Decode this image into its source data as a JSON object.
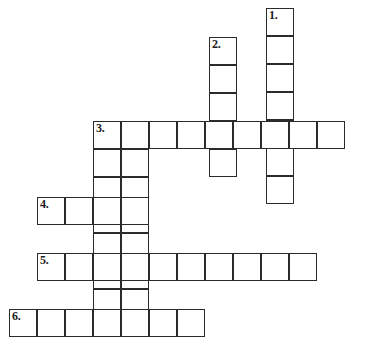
{
  "puzzle": {
    "title": "Crossword Puzzle Grid",
    "type": "crossword-grid",
    "canvas": {
      "width": 365,
      "height": 341
    },
    "cell_size": 28,
    "border_color": "#2b2b2b",
    "cell_fill": "#ffffff",
    "background": "#ffffff",
    "clue_numbers": [
      "1.",
      "2.",
      "3.",
      "4.",
      "5.",
      "6."
    ],
    "entries": [
      {
        "number": "1.",
        "direction": "down",
        "length": 7,
        "start": {
          "x": 266,
          "y": 8
        },
        "label_text": "1."
      },
      {
        "number": "2.",
        "direction": "down",
        "length": 5,
        "start": {
          "x": 209,
          "y": 37
        },
        "label_text": "2."
      },
      {
        "number": "3.",
        "direction": "across",
        "length": 9,
        "start": {
          "x": 93,
          "y": 121
        },
        "label_text": "3."
      },
      {
        "number": "4.",
        "direction": "across",
        "length": 4,
        "start": {
          "x": 37,
          "y": 197
        },
        "label_text": "4."
      },
      {
        "number": "5.",
        "direction": "across",
        "length": 10,
        "start": {
          "x": 37,
          "y": 253
        },
        "label_text": "5."
      },
      {
        "number": "6.",
        "direction": "across",
        "length": 7,
        "start": {
          "x": 9,
          "y": 309
        },
        "label_text": "6."
      },
      {
        "number": "3-down-a",
        "direction": "down",
        "length": 8,
        "start": {
          "x": 93,
          "y": 121
        },
        "label_text": ""
      },
      {
        "number": "3-down-b",
        "direction": "down",
        "length": 8,
        "start": {
          "x": 121,
          "y": 121
        },
        "label_text": ""
      }
    ],
    "cells": [
      {
        "x": 266,
        "y": 8,
        "num": "1."
      },
      {
        "x": 266,
        "y": 36,
        "num": ""
      },
      {
        "x": 266,
        "y": 64,
        "num": ""
      },
      {
        "x": 266,
        "y": 92,
        "num": ""
      },
      {
        "x": 266,
        "y": 120,
        "num": ""
      },
      {
        "x": 266,
        "y": 148,
        "num": ""
      },
      {
        "x": 266,
        "y": 176,
        "num": ""
      },
      {
        "x": 209,
        "y": 37,
        "num": "2."
      },
      {
        "x": 209,
        "y": 65,
        "num": ""
      },
      {
        "x": 209,
        "y": 93,
        "num": ""
      },
      {
        "x": 209,
        "y": 121,
        "num": ""
      },
      {
        "x": 209,
        "y": 149,
        "num": ""
      },
      {
        "x": 93,
        "y": 121,
        "num": "3."
      },
      {
        "x": 121,
        "y": 121,
        "num": ""
      },
      {
        "x": 149,
        "y": 121,
        "num": ""
      },
      {
        "x": 177,
        "y": 121,
        "num": ""
      },
      {
        "x": 205,
        "y": 121,
        "num": ""
      },
      {
        "x": 233,
        "y": 121,
        "num": ""
      },
      {
        "x": 261,
        "y": 121,
        "num": ""
      },
      {
        "x": 289,
        "y": 121,
        "num": ""
      },
      {
        "x": 317,
        "y": 121,
        "num": ""
      },
      {
        "x": 93,
        "y": 149,
        "num": ""
      },
      {
        "x": 93,
        "y": 177,
        "num": ""
      },
      {
        "x": 93,
        "y": 205,
        "num": ""
      },
      {
        "x": 93,
        "y": 233,
        "num": ""
      },
      {
        "x": 93,
        "y": 261,
        "num": ""
      },
      {
        "x": 93,
        "y": 289,
        "num": ""
      },
      {
        "x": 93,
        "y": 309,
        "num": ""
      },
      {
        "x": 121,
        "y": 149,
        "num": ""
      },
      {
        "x": 121,
        "y": 177,
        "num": ""
      },
      {
        "x": 121,
        "y": 205,
        "num": ""
      },
      {
        "x": 121,
        "y": 233,
        "num": ""
      },
      {
        "x": 121,
        "y": 261,
        "num": ""
      },
      {
        "x": 121,
        "y": 289,
        "num": ""
      },
      {
        "x": 121,
        "y": 309,
        "num": ""
      },
      {
        "x": 37,
        "y": 197,
        "num": "4."
      },
      {
        "x": 65,
        "y": 197,
        "num": ""
      },
      {
        "x": 93,
        "y": 197,
        "num": ""
      },
      {
        "x": 121,
        "y": 197,
        "num": ""
      },
      {
        "x": 37,
        "y": 253,
        "num": "5."
      },
      {
        "x": 65,
        "y": 253,
        "num": ""
      },
      {
        "x": 93,
        "y": 253,
        "num": ""
      },
      {
        "x": 121,
        "y": 253,
        "num": ""
      },
      {
        "x": 149,
        "y": 253,
        "num": ""
      },
      {
        "x": 177,
        "y": 253,
        "num": ""
      },
      {
        "x": 205,
        "y": 253,
        "num": ""
      },
      {
        "x": 233,
        "y": 253,
        "num": ""
      },
      {
        "x": 261,
        "y": 253,
        "num": ""
      },
      {
        "x": 289,
        "y": 253,
        "num": ""
      },
      {
        "x": 9,
        "y": 309,
        "num": "6."
      },
      {
        "x": 37,
        "y": 309,
        "num": ""
      },
      {
        "x": 65,
        "y": 309,
        "num": ""
      },
      {
        "x": 93,
        "y": 309,
        "num": ""
      },
      {
        "x": 121,
        "y": 309,
        "num": ""
      },
      {
        "x": 149,
        "y": 309,
        "num": ""
      },
      {
        "x": 177,
        "y": 309,
        "num": ""
      }
    ]
  }
}
